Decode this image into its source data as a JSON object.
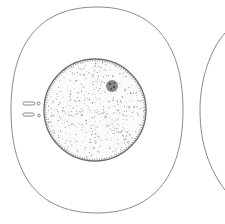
{
  "figure": {
    "colors": {
      "background": "#ffffff",
      "membrane": "#8a8a8a",
      "nucleus_edge": "#6e6e6e",
      "stipple": "#9a9a9a",
      "nucleolus": "#5a5a5a"
    }
  },
  "elements": {
    "outer_cell": {
      "label": "cell membrane",
      "cx": 97,
      "cy": 110,
      "rx": 87,
      "ry": 103
    },
    "nucleus": {
      "label": "nucleus",
      "cx": 95,
      "cy": 110,
      "r": 51
    },
    "nucleolus": {
      "label": "nucleolus",
      "cx": 112,
      "cy": 86,
      "r": 6
    },
    "rods": [
      {
        "label": "rod body 1",
        "x": 24,
        "y": 103
      },
      {
        "label": "rod body 2",
        "x": 24,
        "y": 114
      }
    ],
    "adjacent_cell": {
      "label": "adjacent cell (partial)"
    }
  }
}
